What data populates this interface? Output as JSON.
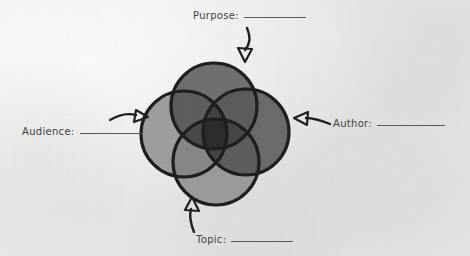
{
  "worksheet": {
    "title": "Rhetorical Situation Venn Diagram",
    "background_color": "#eceae8",
    "ink_color": "#1d1d1d",
    "text_color": "#424242"
  },
  "labels": [
    {
      "id": "purpose",
      "text": "Purpose:",
      "blank": "__________",
      "position": "top",
      "arrow": "curved-arrow-down-icon"
    },
    {
      "id": "author",
      "text": "Author:",
      "blank": "__________",
      "position": "right",
      "arrow": "curved-arrow-left-icon"
    },
    {
      "id": "audience",
      "text": "Audience:",
      "blank": "__________",
      "position": "left",
      "arrow": "curved-arrow-right-icon"
    },
    {
      "id": "topic",
      "text": "Topic:",
      "blank": "__________",
      "position": "bottom",
      "arrow": "curved-arrow-up-icon"
    }
  ],
  "diagram": {
    "type": "venn",
    "set_count": 4,
    "center_x": 222,
    "center_y": 133,
    "circles": [
      {
        "id": "purpose-circle",
        "label": "Purpose",
        "cx": 214,
        "cy": 106,
        "r": 43,
        "fill": "#6f6f6f",
        "stroke": "#1d1d1d"
      },
      {
        "id": "author-circle",
        "label": "Author",
        "cx": 246,
        "cy": 132,
        "r": 43,
        "fill": "#6a6a6a",
        "stroke": "#1d1d1d"
      },
      {
        "id": "topic-circle",
        "label": "Topic",
        "cx": 216,
        "cy": 162,
        "r": 43,
        "fill": "#9a9a9a",
        "stroke": "#1d1d1d"
      },
      {
        "id": "audience-circle",
        "label": "Audience",
        "cx": 184,
        "cy": 134,
        "r": 43,
        "fill": "#9e9e9e",
        "stroke": "#1d1d1d"
      }
    ],
    "stroke_width": 3.2
  }
}
